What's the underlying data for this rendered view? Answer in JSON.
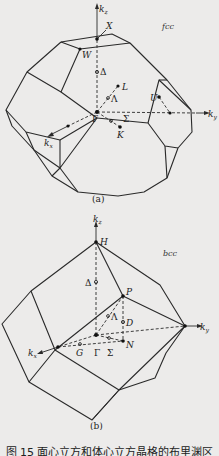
{
  "figure": {
    "caption": "图 15  面心立方和体心立方晶格的布里渊区",
    "panels": [
      {
        "id": "a",
        "sublabel": "(a)",
        "lattice_tag": "fcc",
        "axes": {
          "z": "k_z",
          "y": "k_y",
          "x": "k_x"
        },
        "axis_labels": {
          "z": "kz",
          "y": "ky",
          "x": "kx"
        },
        "points": [
          "X",
          "W",
          "Δ",
          "L",
          "Λ",
          "U",
          "Γ",
          "Σ",
          "K"
        ]
      },
      {
        "id": "b",
        "sublabel": "(b)",
        "lattice_tag": "bcc",
        "axes": {
          "z": "k_z",
          "y": "k_y",
          "x": "k_x"
        },
        "axis_labels": {
          "z": "kz",
          "y": "ky",
          "x": "kx"
        },
        "points": [
          "H",
          "Δ",
          "P",
          "Λ",
          "D",
          "G",
          "Γ",
          "Σ",
          "N"
        ]
      }
    ]
  }
}
